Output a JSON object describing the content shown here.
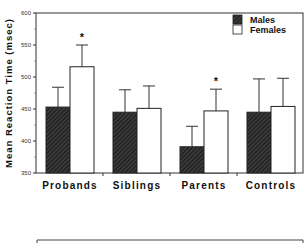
{
  "chart_data": {
    "type": "bar",
    "title": "",
    "xlabel": "",
    "ylabel": "Mean Reaction Time (msec)",
    "ylim": [
      350,
      600
    ],
    "yticks": [
      350,
      400,
      450,
      500,
      550,
      600
    ],
    "categories": [
      "Probands",
      "Siblings",
      "Parents",
      "Controls"
    ],
    "series": [
      {
        "name": "Males",
        "fill": "hatched-dark",
        "values": [
          453,
          445,
          391,
          445
        ],
        "error_upper": [
          484,
          480,
          423,
          497
        ]
      },
      {
        "name": "Females",
        "fill": "white",
        "values": [
          516,
          451,
          447,
          454
        ],
        "error_upper": [
          550,
          486,
          481,
          498
        ]
      }
    ],
    "annotations": [
      {
        "text": "*",
        "category": "Probands",
        "series": "Females"
      },
      {
        "text": "*",
        "category": "Parents",
        "series": "Females"
      }
    ],
    "legend_position": "top-right",
    "grid": false
  },
  "legend": {
    "males": "Males",
    "females": "Females"
  },
  "axis": {
    "ylabel": "Mean Reaction Time (msec)"
  },
  "colors": {
    "male_fill": "#2a2a2a",
    "female_fill": "#ffffff",
    "stroke": "#222222"
  }
}
